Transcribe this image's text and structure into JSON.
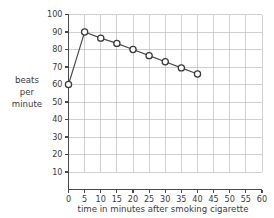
{
  "chart_data": {
    "type": "line",
    "title": "",
    "xlabel": "time in minutes after smoking cigarette",
    "ylabel": "beats per minute",
    "ylabel_lines": [
      "beats",
      "per",
      "minute"
    ],
    "x": [
      0,
      5,
      10,
      15,
      20,
      25,
      30,
      35,
      40
    ],
    "values": [
      60,
      90,
      86.5,
      83.5,
      80,
      76.5,
      73,
      69.5,
      66
    ],
    "series": [
      {
        "name": "heart rate",
        "values": [
          60,
          90,
          86.5,
          83.5,
          80,
          76.5,
          73,
          69.5,
          66
        ]
      }
    ],
    "xlim": [
      0,
      60
    ],
    "ylim": [
      0,
      100
    ],
    "xticks": [
      0,
      5,
      10,
      15,
      20,
      25,
      30,
      35,
      40,
      45,
      50,
      55,
      60
    ],
    "yticks": [
      10,
      20,
      30,
      40,
      50,
      60,
      70,
      80,
      90,
      100
    ],
    "xtick_labels": [
      "0",
      "5",
      "10",
      "15",
      "20",
      "25",
      "30",
      "35",
      "40",
      "45",
      "50",
      "55",
      "60"
    ],
    "ytick_labels": [
      "10",
      "20",
      "30",
      "40",
      "50",
      "60",
      "70",
      "80",
      "90",
      "100"
    ],
    "grid": true,
    "legend": false,
    "marker": "open-circle",
    "colors": {
      "line": "#4a4a4a",
      "marker_fill": "#ffffff",
      "marker_stroke": "#3a3a3a",
      "grid": "#bcbcbc",
      "axis": "#4a4a4a",
      "text": "#3b3b3b",
      "background": "#ffffff"
    }
  }
}
